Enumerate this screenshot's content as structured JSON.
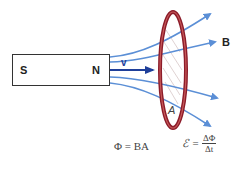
{
  "diagram": {
    "magnet": {
      "south_label": "S",
      "north_label": "N"
    },
    "velocity_label": "v",
    "field_label": "B",
    "area_label": "A",
    "formulas": {
      "flux_lhs": "Φ = BA",
      "emf_lhs": "ℰ =",
      "emf_numerator": "ΔΦ",
      "emf_denominator": "Δt"
    },
    "colors": {
      "field_lines": "#5b8fd6",
      "velocity_arrow": "#1f3f9a",
      "loop": "#8c1c2a",
      "loop_inner": "#c85a5a"
    }
  }
}
